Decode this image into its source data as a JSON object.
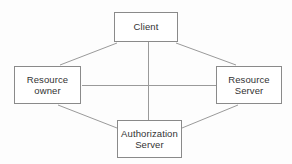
{
  "diagram": {
    "type": "block-diagram",
    "canvas": {
      "width": 292,
      "height": 164,
      "background": "#fdfdfd"
    },
    "style": {
      "node_border_color": "#8a8a8a",
      "node_fill_color": "#ffffff",
      "edge_color": "#9a9a9a",
      "text_color": "#333333"
    },
    "nodes": [
      {
        "id": "client",
        "label": "Client",
        "x": 114,
        "y": 12,
        "width": 64,
        "height": 30
      },
      {
        "id": "resource-owner",
        "label": "Resource\nowner",
        "x": 14,
        "y": 66,
        "width": 67,
        "height": 38
      },
      {
        "id": "resource-server",
        "label": "Resource\nServer",
        "x": 216,
        "y": 66,
        "width": 66,
        "height": 38
      },
      {
        "id": "authorization-server",
        "label": "Authorization\nServer",
        "x": 117,
        "y": 120,
        "width": 65,
        "height": 38
      }
    ],
    "edges": [
      {
        "id": "client-to-resource-owner",
        "from": "client",
        "to": "resource-owner",
        "x1": 117,
        "y1": 43,
        "x2": 60,
        "y2": 65
      },
      {
        "id": "client-to-resource-server",
        "from": "client",
        "to": "resource-server",
        "x1": 176,
        "y1": 43,
        "x2": 236,
        "y2": 65
      },
      {
        "id": "resource-owner-to-authorization-server",
        "from": "resource-owner",
        "to": "authorization-server",
        "x1": 58,
        "y1": 105,
        "x2": 117,
        "y2": 128
      },
      {
        "id": "resource-server-to-authorization-server",
        "from": "resource-server",
        "to": "authorization-server",
        "x1": 238,
        "y1": 105,
        "x2": 182,
        "y2": 128
      },
      {
        "id": "resource-owner-to-resource-server",
        "from": "resource-owner",
        "to": "resource-server",
        "x1": 82,
        "y1": 85,
        "x2": 216,
        "y2": 85
      },
      {
        "id": "client-to-authorization-server",
        "from": "client",
        "to": "authorization-server",
        "x1": 148,
        "y1": 43,
        "x2": 148,
        "y2": 120
      }
    ]
  }
}
